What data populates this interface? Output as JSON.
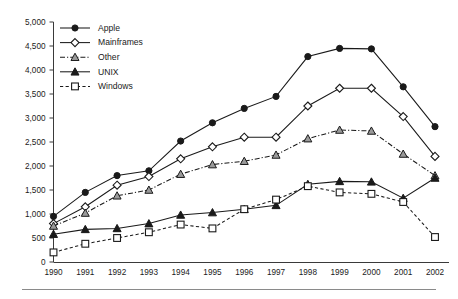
{
  "chart_data": {
    "type": "line",
    "title": "",
    "subtitle": "",
    "xlabel": "",
    "ylabel": "",
    "grid": false,
    "legend_position": "top-left-inside",
    "categories": [
      "1990",
      "1991",
      "1992",
      "1993",
      "1994",
      "1995",
      "1996",
      "1997",
      "1998",
      "1999",
      "2000",
      "2001",
      "2002"
    ],
    "x": [
      1990,
      1991,
      1992,
      1993,
      1994,
      1995,
      1996,
      1997,
      1998,
      1999,
      2000,
      2001,
      2002
    ],
    "xlim": [
      1990,
      2002
    ],
    "ylim": [
      0,
      5000
    ],
    "ytick_values": [
      0,
      500,
      1000,
      1500,
      2000,
      2500,
      3000,
      3500,
      4000,
      4500,
      5000
    ],
    "ytick_labels": [
      "0",
      "500",
      "1,000",
      "1,500",
      "2,000",
      "2,500",
      "3,000",
      "3,500",
      "4,000",
      "4,500",
      "5,000"
    ],
    "series": [
      {
        "name": "Apple",
        "marker": "filled-circle",
        "line_style": "solid",
        "values": [
          950,
          1450,
          1800,
          1900,
          2520,
          2900,
          3200,
          3450,
          4280,
          4450,
          4440,
          3650,
          2820
        ]
      },
      {
        "name": "Mainframes",
        "marker": "open-diamond",
        "line_style": "solid",
        "values": [
          800,
          1150,
          1600,
          1780,
          2150,
          2400,
          2600,
          2600,
          3250,
          3620,
          3620,
          3030,
          2200
        ]
      },
      {
        "name": "Other",
        "marker": "open-triangle",
        "line_style": "dash-dot",
        "values": [
          750,
          1020,
          1380,
          1500,
          1830,
          2030,
          2100,
          2230,
          2570,
          2750,
          2730,
          2250,
          1800
        ]
      },
      {
        "name": "UNIX",
        "marker": "filled-triangle",
        "line_style": "solid",
        "values": [
          580,
          680,
          700,
          800,
          980,
          1030,
          1100,
          1180,
          1620,
          1680,
          1670,
          1330,
          1750
        ]
      },
      {
        "name": "Windows",
        "marker": "open-square",
        "line_style": "dashed",
        "values": [
          200,
          380,
          500,
          620,
          780,
          700,
          1100,
          1300,
          1580,
          1450,
          1420,
          1250,
          520
        ]
      }
    ]
  },
  "legend": {
    "items": [
      {
        "label": "Apple"
      },
      {
        "label": "Mainframes"
      },
      {
        "label": "Other"
      },
      {
        "label": "UNIX"
      },
      {
        "label": "Windows"
      }
    ]
  },
  "colors": {
    "ink": "#1a1a1a",
    "axis": "#3a3a3a",
    "rule": "#8a8a8a",
    "background": "#ffffff",
    "marker_fill_open": "#ffffff",
    "marker_fill_grey": "#9a9a9a"
  }
}
